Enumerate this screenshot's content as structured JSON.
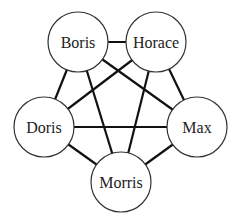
{
  "diagram": {
    "type": "complete-graph",
    "nodes": [
      {
        "id": "boris",
        "label": "Boris",
        "x": 78,
        "y": 42,
        "r": 30
      },
      {
        "id": "horace",
        "label": "Horace",
        "x": 156,
        "y": 42,
        "r": 30
      },
      {
        "id": "doris",
        "label": "Doris",
        "x": 44,
        "y": 127,
        "r": 30
      },
      {
        "id": "max",
        "label": "Max",
        "x": 197,
        "y": 127,
        "r": 30
      },
      {
        "id": "morris",
        "label": "Morris",
        "x": 121,
        "y": 182,
        "r": 30
      }
    ],
    "edges": [
      [
        "boris",
        "horace"
      ],
      [
        "boris",
        "doris"
      ],
      [
        "boris",
        "max"
      ],
      [
        "boris",
        "morris"
      ],
      [
        "horace",
        "doris"
      ],
      [
        "horace",
        "max"
      ],
      [
        "horace",
        "morris"
      ],
      [
        "doris",
        "max"
      ],
      [
        "doris",
        "morris"
      ],
      [
        "max",
        "morris"
      ]
    ]
  }
}
